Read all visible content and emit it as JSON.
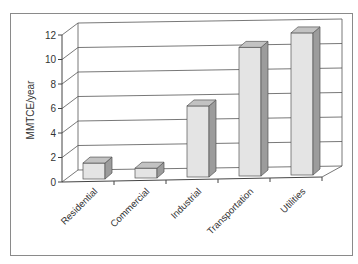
{
  "chart_data": {
    "type": "bar",
    "style": "3d-column",
    "title": "",
    "xlabel": "",
    "ylabel": "MMTCE/year",
    "categories": [
      "Residential",
      "Commercial",
      "Industrial",
      "Transportation",
      "Utilities"
    ],
    "values": [
      1.3,
      0.8,
      5.8,
      10.5,
      11.6
    ],
    "ylim": [
      0,
      12
    ],
    "yticks": [
      0,
      2,
      4,
      6,
      8,
      10,
      12
    ],
    "grid": true,
    "legend": null
  },
  "colors": {
    "bar_front": "#e4e4e4",
    "bar_side": "#9c9c9c",
    "bar_top": "#c2c2c2",
    "frame": "#8a8a8a"
  }
}
